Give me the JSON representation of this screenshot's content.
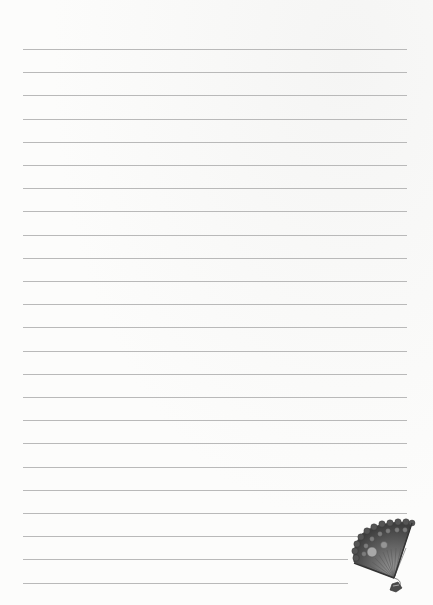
{
  "page": {
    "type": "lined-writing-paper",
    "background_color": "#fbfbfa",
    "rule_color": "#b9b9b9"
  },
  "rules": {
    "count": 24,
    "top_y": 49,
    "spacing": 23.2,
    "left_x": 23,
    "default_right_x": 407,
    "short_lines": [
      {
        "index": 21,
        "right_x": 360
      },
      {
        "index": 22,
        "right_x": 348
      },
      {
        "index": 23,
        "right_x": 348
      }
    ]
  },
  "decoration": {
    "name": "folding-fan",
    "style": "grayscale engraving",
    "position": "bottom-right"
  }
}
